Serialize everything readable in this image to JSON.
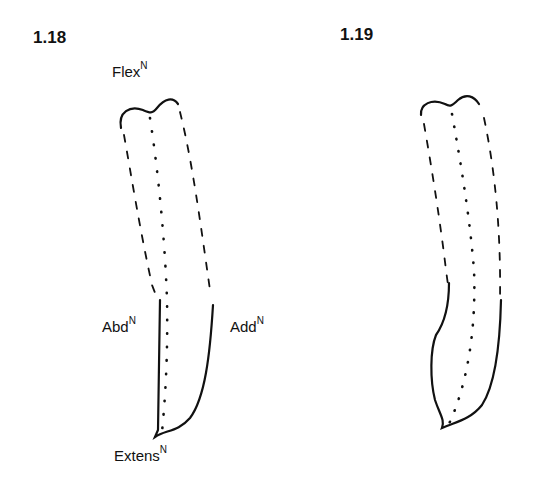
{
  "figures": [
    {
      "number": "1.18",
      "labels": {
        "flex": {
          "text": "Flex",
          "sup": "N"
        },
        "abd": {
          "text": "Abd",
          "sup": "N"
        },
        "add": {
          "text": "Add",
          "sup": "N"
        },
        "extens": {
          "text": "Extens",
          "sup": "N"
        }
      }
    },
    {
      "number": "1.19"
    }
  ],
  "colors": {
    "ink": "#111111",
    "background": "#ffffff"
  }
}
